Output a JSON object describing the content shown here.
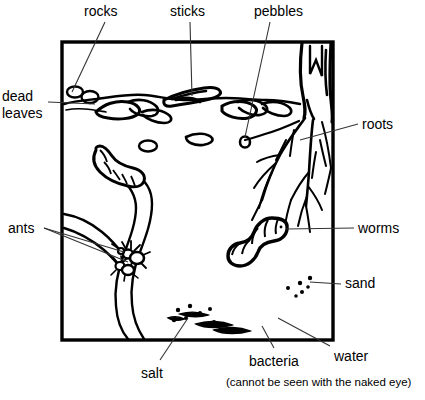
{
  "diagram": {
    "frame": {
      "x": 62,
      "y": 42,
      "width": 271,
      "height": 298,
      "stroke": "#000000",
      "stroke_width": 3
    },
    "colors": {
      "ink": "#000000",
      "paper": "#ffffff",
      "leader": "#333333"
    },
    "labels": [
      {
        "id": "rocks",
        "text": "rocks",
        "x": 84,
        "y": 6,
        "align": "left"
      },
      {
        "id": "sticks",
        "text": "sticks",
        "x": 170,
        "y": 6,
        "align": "left"
      },
      {
        "id": "pebbles",
        "text": "pebbles",
        "x": 254,
        "y": 6,
        "align": "left"
      },
      {
        "id": "dead-leaves-line1",
        "text": "dead",
        "x": 2,
        "y": 90,
        "align": "left"
      },
      {
        "id": "dead-leaves-line2",
        "text": "leaves",
        "x": 2,
        "y": 106,
        "align": "left"
      },
      {
        "id": "roots",
        "text": "roots",
        "x": 362,
        "y": 120,
        "align": "left"
      },
      {
        "id": "ants",
        "text": "ants",
        "x": 8,
        "y": 224,
        "align": "left"
      },
      {
        "id": "worms",
        "text": "worms",
        "x": 358,
        "y": 223,
        "align": "left"
      },
      {
        "id": "sand",
        "text": "sand",
        "x": 345,
        "y": 278,
        "align": "left"
      },
      {
        "id": "salt",
        "text": "salt",
        "x": 141,
        "y": 368,
        "align": "left"
      },
      {
        "id": "bacteria",
        "text": "bacteria",
        "x": 249,
        "y": 357,
        "align": "left"
      },
      {
        "id": "water",
        "text": "water",
        "x": 334,
        "y": 352,
        "align": "left"
      },
      {
        "id": "note",
        "text": "(cannot be seen with the naked eye)",
        "x": 226,
        "y": 376,
        "align": "left",
        "size": "small"
      }
    ],
    "leaders": [
      {
        "id": "leader-rocks",
        "from": [
          105,
          22
        ],
        "to": [
          72,
          92
        ]
      },
      {
        "id": "leader-sticks",
        "from": [
          190,
          22
        ],
        "to": [
          192,
          96
        ]
      },
      {
        "id": "leader-pebbles",
        "from": [
          270,
          22
        ],
        "to": [
          245,
          104
        ]
      },
      {
        "id": "leader-dead-leaves",
        "from": [
          48,
          102
        ],
        "to": [
          92,
          102
        ]
      },
      {
        "id": "leader-roots",
        "from": [
          358,
          125
        ],
        "to": [
          318,
          130
        ]
      },
      {
        "id": "leader-ants-a",
        "from": [
          44,
          228
        ],
        "to": [
          120,
          248
        ]
      },
      {
        "id": "leader-ants-b",
        "from": [
          44,
          228
        ],
        "to": [
          126,
          258
        ]
      },
      {
        "id": "leader-worms",
        "from": [
          354,
          228
        ],
        "to": [
          288,
          231
        ]
      },
      {
        "id": "leader-sand",
        "from": [
          341,
          284
        ],
        "to": [
          310,
          283
        ]
      },
      {
        "id": "leader-salt",
        "from": [
          160,
          362
        ],
        "to": [
          190,
          320
        ]
      },
      {
        "id": "leader-bacteria",
        "from": [
          275,
          350
        ],
        "to": [
          262,
          327
        ]
      },
      {
        "id": "leader-water",
        "from": [
          330,
          348
        ],
        "to": [
          280,
          320
        ]
      }
    ],
    "elements": {
      "tree_trunk": "top-right trunk with vertical bark lines",
      "roots_cluster": "branching root system below trunk",
      "surface_layer": "leaf litter band across top of soil",
      "rocks": "small oval stones at top-left of surface",
      "stick": "twig shape in upper-middle surface",
      "pebble_small": "small oval below leaves",
      "worm_upper_left": "segmented worm in upper-left tunnel",
      "worm_right": "segmented worm center-right",
      "ant_nest": "ants inside tunnel at mid-left",
      "tunnels": "winding burrow channels through soil",
      "sand_dots": "scattered dots right of center-lower",
      "salt_dots": "small dots near bottom-center",
      "bacteria_squiggles": "elongated squiggle shapes near bottom-center"
    }
  }
}
